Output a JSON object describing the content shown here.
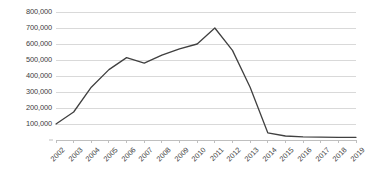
{
  "chart_data": {
    "type": "line",
    "title": "",
    "subtitle": "",
    "xlabel": "",
    "ylabel": "",
    "grid": true,
    "legend": false,
    "legend_position": "none",
    "line_color": "#404040",
    "gridline_color": "#d9d9d9",
    "axis_color": "#bfbfbf",
    "text_color": "#3d3d3d",
    "background_color": "#ffffff",
    "x": [
      2002,
      2003,
      2004,
      2005,
      2006,
      2007,
      2008,
      2009,
      2010,
      2011,
      2012,
      2013,
      2014,
      2015,
      2016,
      2017,
      2018,
      2019
    ],
    "categories": [
      "2002",
      "2003",
      "2004",
      "2005",
      "2006",
      "2007",
      "2008",
      "2009",
      "2010",
      "2011",
      "2012",
      "2013",
      "2014",
      "2015",
      "2016",
      "2017",
      "2018",
      "2019"
    ],
    "values": [
      100000,
      175000,
      330000,
      440000,
      515000,
      480000,
      530000,
      570000,
      600000,
      700000,
      560000,
      330000,
      45000,
      25000,
      20000,
      18000,
      17000,
      17000
    ],
    "series": [
      {
        "name": "series-1",
        "values": [
          100000,
          175000,
          330000,
          440000,
          515000,
          480000,
          530000,
          570000,
          600000,
          700000,
          560000,
          330000,
          45000,
          25000,
          20000,
          18000,
          17000,
          17000
        ]
      }
    ],
    "ylim": [
      0,
      800000
    ],
    "ytick_values": [
      0,
      100000,
      200000,
      300000,
      400000,
      500000,
      600000,
      700000,
      800000
    ],
    "ytick_labels": [
      "",
      "100,000",
      "200,000",
      "300,000",
      "400,000",
      "500,000",
      "600,000",
      "700,000",
      "800,000"
    ],
    "xtick_labels": [
      "2002",
      "2003",
      "2004",
      "2005",
      "2006",
      "2007",
      "2008",
      "2009",
      "2010",
      "2011",
      "2012",
      "2013",
      "2014",
      "2015",
      "2016",
      "2017",
      "2018",
      "2019"
    ],
    "xtick_rotation": -45,
    "annotations": []
  }
}
